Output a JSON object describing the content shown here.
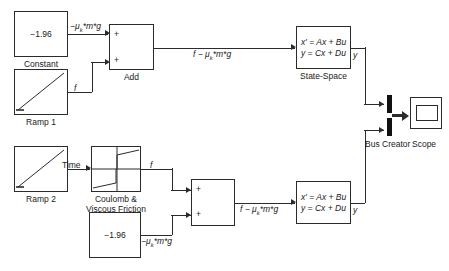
{
  "diagram": {
    "background_color": "#ffffff",
    "line_color": "#2b2b2b"
  },
  "blocks": {
    "constant_top": {
      "label": "Constant",
      "value": "−1.96",
      "icon": "constant-block"
    },
    "ramp1": {
      "label": "Ramp 1",
      "icon": "ramp-icon"
    },
    "add_top": {
      "label": "Add",
      "input1_sign": "+",
      "input2_sign": "+",
      "icon": "sum-block"
    },
    "statespace_top": {
      "label": "State-Space",
      "equation_line1": "x′ = Ax + Bu",
      "equation_line2": "y = Cx + Du",
      "output_label": "y",
      "icon": "state-space-block"
    },
    "ramp2": {
      "label": "Ramp 2",
      "icon": "ramp-icon"
    },
    "friction": {
      "label_line1": "Coulomb &",
      "label_line2": "Viscous Friction",
      "icon": "coulomb-viscous-friction-icon"
    },
    "constant_bottom": {
      "label": "",
      "value": "−1.96",
      "icon": "constant-block"
    },
    "add_bottom": {
      "label": "",
      "input1_sign": "+",
      "input2_sign": "+",
      "icon": "sum-block"
    },
    "statespace_bottom": {
      "label": "",
      "equation_line1": "x′ = Ax + Bu",
      "equation_line2": "y = Cx + Du",
      "output_label": "y",
      "icon": "state-space-block"
    },
    "bus_creator": {
      "label": "Bus Creator",
      "icon": "bus-creator-icon"
    },
    "scope": {
      "label": "Scope",
      "icon": "scope-icon"
    }
  },
  "signals": {
    "const_top_out": "−μₖ*m*g",
    "ramp1_out": "f",
    "add_top_out": "f − μₖ*m*g",
    "ramp2_out": "Time",
    "friction_out": "f",
    "const_bottom_out": "−μₖ*m*g",
    "add_bottom_out": "f − μₖ*m*g"
  }
}
